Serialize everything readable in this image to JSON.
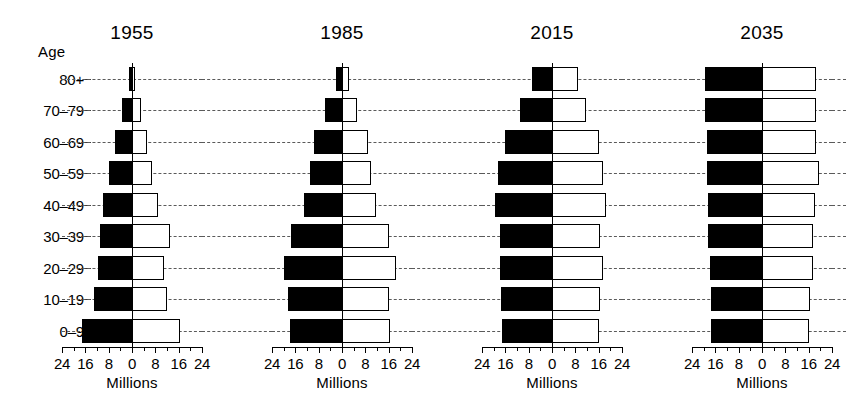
{
  "figure": {
    "age_axis_caption": "Age",
    "x_axis_title": "Millions"
  },
  "chart_data": {
    "type": "bar",
    "subtype": "population-pyramid",
    "title": "",
    "xlabel": "Millions",
    "ylabel": "Age",
    "xlim": [
      -24,
      24
    ],
    "xticks": [
      24,
      16,
      8,
      0,
      8,
      16,
      24
    ],
    "xtick_labels": [
      "24",
      "16",
      "8",
      "0",
      "8",
      "16",
      "24"
    ],
    "xtick_minor_step": 4,
    "grid": "horizontal-dashed",
    "legend": [],
    "units": "millions of people",
    "categories": [
      "0-9",
      "10-19",
      "20-29",
      "30-39",
      "40-49",
      "50-59",
      "60-69",
      "70-79",
      "80+"
    ],
    "category_labels_bottom_to_top": [
      "0–9",
      "10–19",
      "20–29",
      "30–39",
      "40–49",
      "50–59",
      "60–69",
      "70–79",
      "80+"
    ],
    "series_sides": {
      "left": "male",
      "right": "female"
    },
    "panels": [
      {
        "year": "1955",
        "left_values": [
          17.0,
          13.0,
          11.5,
          11.0,
          10.0,
          8.0,
          6.0,
          3.5,
          1.0
        ],
        "right_values": [
          16.5,
          12.0,
          11.0,
          13.0,
          9.0,
          7.0,
          5.0,
          3.0,
          1.0
        ]
      },
      {
        "year": "1985",
        "left_values": [
          18.0,
          18.5,
          20.0,
          17.5,
          13.0,
          11.0,
          9.5,
          6.0,
          2.0
        ],
        "right_values": [
          16.5,
          16.0,
          18.5,
          16.0,
          11.5,
          10.0,
          9.0,
          5.0,
          2.5
        ]
      },
      {
        "year": "2015",
        "left_values": [
          17.0,
          17.5,
          18.0,
          18.0,
          19.5,
          18.5,
          16.0,
          11.0,
          7.0
        ],
        "right_values": [
          16.0,
          16.5,
          17.5,
          16.5,
          18.5,
          17.5,
          16.0,
          11.5,
          9.0
        ]
      },
      {
        "year": "2035",
        "left_values": [
          17.5,
          17.5,
          18.0,
          18.5,
          18.5,
          19.0,
          19.0,
          19.5,
          19.5
        ],
        "right_values": [
          16.0,
          16.5,
          17.5,
          17.5,
          18.0,
          19.5,
          18.5,
          18.5,
          18.5
        ]
      }
    ]
  },
  "colors": {
    "male_fill": "#000000",
    "female_fill": "#ffffff",
    "outline": "#000000",
    "gridline": "#5a5a5a",
    "background": "#ffffff"
  }
}
